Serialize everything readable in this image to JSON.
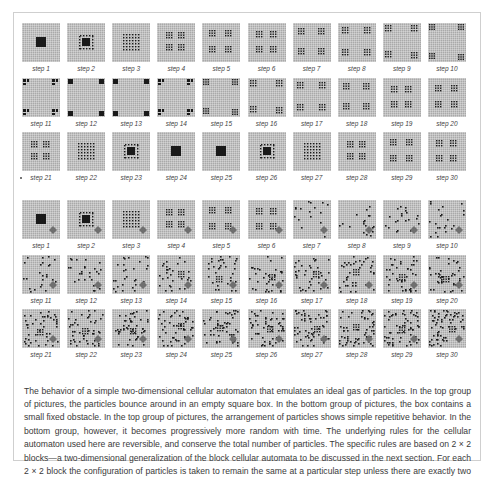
{
  "figure": {
    "groups": [
      {
        "id": "top-group",
        "description": "particles in empty square box",
        "obstacle": false,
        "rows": [
          {
            "steps": [
              {
                "label": "step 1",
                "pattern": "block"
              },
              {
                "label": "step 2",
                "pattern": "ring"
              },
              {
                "label": "step 3",
                "pattern": "dots-center-6"
              },
              {
                "label": "step 4",
                "pattern": "quad-clusters-near"
              },
              {
                "label": "step 5",
                "pattern": "quad-clusters-mid"
              },
              {
                "label": "step 6",
                "pattern": "quad-clusters-mid2"
              },
              {
                "label": "step 7",
                "pattern": "quad-clusters-far"
              },
              {
                "label": "step 8",
                "pattern": "quad-clusters-far2"
              },
              {
                "label": "step 9",
                "pattern": "corner-clusters"
              },
              {
                "label": "step 10",
                "pattern": "corner-clusters-edge"
              }
            ]
          },
          {
            "steps": [
              {
                "label": "step 11",
                "pattern": "corner-split"
              },
              {
                "label": "step 12",
                "pattern": "corner-blocks"
              },
              {
                "label": "step 13",
                "pattern": "corner-blocks"
              },
              {
                "label": "step 14",
                "pattern": "corner-split"
              },
              {
                "label": "step 15",
                "pattern": "corner-clusters-edge"
              },
              {
                "label": "step 16",
                "pattern": "corner-clusters"
              },
              {
                "label": "step 17",
                "pattern": "quad-clusters-far2"
              },
              {
                "label": "step 18",
                "pattern": "quad-clusters-far"
              },
              {
                "label": "step 19",
                "pattern": "quad-clusters-mid2"
              },
              {
                "label": "step 20",
                "pattern": "quad-clusters-mid"
              }
            ]
          },
          {
            "steps": [
              {
                "label": "step 21",
                "pattern": "quad-clusters-near"
              },
              {
                "label": "step 22",
                "pattern": "dots-center-6"
              },
              {
                "label": "step 23",
                "pattern": "ring"
              },
              {
                "label": "step 24",
                "pattern": "block"
              },
              {
                "label": "step 25",
                "pattern": "block"
              },
              {
                "label": "step 26",
                "pattern": "ring"
              },
              {
                "label": "step 27",
                "pattern": "dots-center-6"
              },
              {
                "label": "step 28",
                "pattern": "quad-clusters-near"
              },
              {
                "label": "step 29",
                "pattern": "quad-clusters-mid"
              },
              {
                "label": "step 30",
                "pattern": "quad-clusters-mid2"
              }
            ]
          }
        ]
      },
      {
        "id": "bottom-group",
        "description": "box contains a small fixed obstacle",
        "obstacle": true,
        "rows": [
          {
            "steps": [
              {
                "label": "step 1",
                "pattern": "block"
              },
              {
                "label": "step 2",
                "pattern": "ring"
              },
              {
                "label": "step 3",
                "pattern": "dots-center-6"
              },
              {
                "label": "step 4",
                "pattern": "quad-clusters-near"
              },
              {
                "label": "step 5",
                "pattern": "quad-clusters-mid"
              },
              {
                "label": "step 6",
                "pattern": "quad-clusters-mid2"
              },
              {
                "label": "step 7",
                "pattern": "scatter-1"
              },
              {
                "label": "step 8",
                "pattern": "scatter-2"
              },
              {
                "label": "step 9",
                "pattern": "scatter-3"
              },
              {
                "label": "step 10",
                "pattern": "scatter-4"
              }
            ]
          },
          {
            "steps": [
              {
                "label": "step 11",
                "pattern": "scatter-5"
              },
              {
                "label": "step 12",
                "pattern": "scatter-6"
              },
              {
                "label": "step 13",
                "pattern": "scatter-7"
              },
              {
                "label": "step 14",
                "pattern": "scatter-8"
              },
              {
                "label": "step 15",
                "pattern": "scatter-9"
              },
              {
                "label": "step 16",
                "pattern": "scatter-10"
              },
              {
                "label": "step 17",
                "pattern": "scatter-11"
              },
              {
                "label": "step 18",
                "pattern": "scatter-12"
              },
              {
                "label": "step 19",
                "pattern": "scatter-13"
              },
              {
                "label": "step 20",
                "pattern": "scatter-14"
              }
            ]
          },
          {
            "steps": [
              {
                "label": "step 21",
                "pattern": "scatter-15"
              },
              {
                "label": "step 22",
                "pattern": "scatter-16"
              },
              {
                "label": "step 23",
                "pattern": "scatter-17"
              },
              {
                "label": "step 24",
                "pattern": "scatter-18"
              },
              {
                "label": "step 25",
                "pattern": "scatter-19"
              },
              {
                "label": "step 26",
                "pattern": "scatter-20"
              },
              {
                "label": "step 27",
                "pattern": "scatter-21"
              },
              {
                "label": "step 28",
                "pattern": "scatter-22"
              },
              {
                "label": "step 29",
                "pattern": "scatter-23"
              },
              {
                "label": "step 30",
                "pattern": "scatter-24"
              }
            ]
          }
        ]
      }
    ],
    "colors": {
      "tile_bg": "#a9a9a9",
      "particle": "#1a1a1a",
      "obstacle": "#6f6f6f",
      "frame_border": "#cfcfcf",
      "caption_text": "#3a3a3a"
    }
  },
  "caption": {
    "text": "The behavior of a simple two-dimensional cellular automaton that emulates an ideal gas of particles. In the top group of pictures, the particles bounce around in an empty square box. In the bottom group of pictures, the box contains a small fixed obstacle. In the top group of pictures, the arrangement of particles shows simple repetitive behavior. In the bottom group, however, it becomes progressively more random with time. The underlying rules for the cellular automaton used here are reversible, and conserve the total number of particles. The specific rules are based on 2 × 2 blocks—a two-dimensional generalization of the block cellular automata to be discussed in the next section. For each 2 × 2 block the configuration of particles is taken to remain the same at a particular step unless there are exactly two particles arranged diagonally within the block, in which case the particles move to the opposite diagonal."
  }
}
